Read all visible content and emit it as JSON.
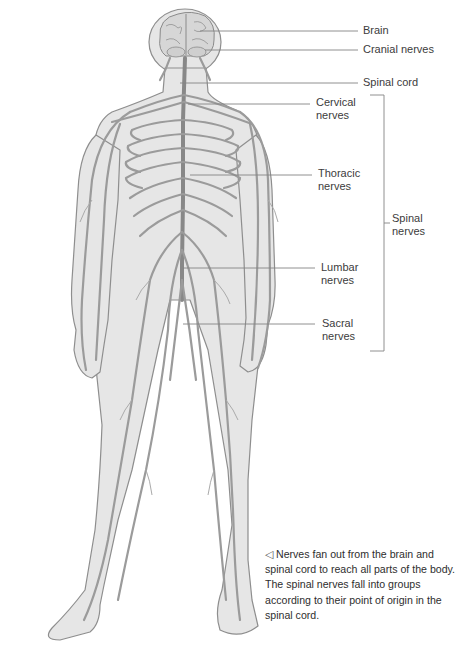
{
  "diagram": {
    "colors": {
      "body_fill": "#e4e4e4",
      "body_outline": "#8e8e8e",
      "nerve": "#9a9a9a",
      "spinal_cord": "#8a8a8a",
      "leader_line": "#7a7a7a",
      "text": "#3a3a3a"
    },
    "labels": [
      {
        "id": "brain",
        "text": "Brain"
      },
      {
        "id": "cranial",
        "text": "Cranial nerves"
      },
      {
        "id": "spinal_cord",
        "text": "Spinal cord"
      },
      {
        "id": "cervical",
        "line1": "Cervical",
        "line2": "nerves"
      },
      {
        "id": "thoracic",
        "line1": "Thoracic",
        "line2": "nerves"
      },
      {
        "id": "lumbar",
        "line1": "Lumbar",
        "line2": "nerves"
      },
      {
        "id": "sacral",
        "line1": "Sacral",
        "line2": "nerves"
      },
      {
        "id": "spinal_nerves",
        "line1": "Spinal",
        "line2": "nerves"
      }
    ],
    "caption": {
      "arrow_icon": "◁",
      "text": "Nerves fan out from the brain and spinal cord to reach all parts of the body. The spinal nerves fall into groups according to their point of origin in the spinal cord."
    }
  }
}
